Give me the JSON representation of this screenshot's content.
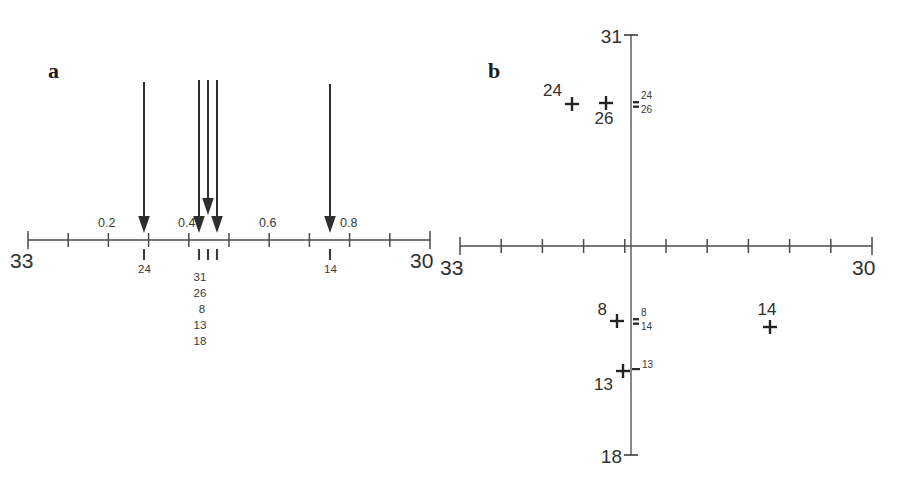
{
  "figure": {
    "background_color": "#ffffff",
    "ink_color": "#2f2f2f"
  },
  "panel_a": {
    "label": "a",
    "axis": {
      "left_endpoint_label": "33",
      "right_endpoint_label": "30",
      "scale_labels": [
        "0.2",
        "0.4",
        "0.6",
        "0.8"
      ],
      "tick_count": 11
    },
    "arrows": [
      {
        "sample": "24",
        "value": 0.28,
        "short": false
      },
      {
        "sample": "31",
        "value": 0.41,
        "short": false
      },
      {
        "sample": "26",
        "value": 0.435,
        "short": true
      },
      {
        "sample": "8",
        "value": 0.455,
        "short": false
      },
      {
        "sample": "14",
        "value": 0.745,
        "short": false
      }
    ],
    "sample_ticks": [
      {
        "label": "24",
        "value": 0.28
      },
      {
        "label": "",
        "value": 0.415
      },
      {
        "label": "",
        "value": 0.437
      },
      {
        "label": "",
        "value": 0.459
      },
      {
        "label": "14",
        "value": 0.745
      }
    ],
    "cluster_labels": [
      "31",
      "26",
      "8",
      "13",
      "18"
    ]
  },
  "panel_b": {
    "label": "b",
    "x_axis": {
      "left_endpoint_label": "33",
      "right_endpoint_label": "30",
      "tick_count": 11
    },
    "y_axis": {
      "top_endpoint_label": "31",
      "bottom_endpoint_label": "18"
    },
    "points": [
      {
        "label": "24",
        "label_pos": "upper-left",
        "x": 572,
        "y": 104
      },
      {
        "label": "26",
        "label_pos": "lower-right",
        "x": 606,
        "y": 103
      },
      {
        "label": "8",
        "label_pos": "upper-left",
        "x": 617,
        "y": 321
      },
      {
        "label": "13",
        "label_pos": "lower-left",
        "x": 623,
        "y": 371
      },
      {
        "label": "14",
        "label_pos": "upper-left",
        "x": 770,
        "y": 327
      }
    ],
    "axis_annotations": [
      {
        "label": "24",
        "marker": "=",
        "y": 96
      },
      {
        "label": "26",
        "marker": "",
        "y": 110
      },
      {
        "label": "8",
        "marker": "=",
        "y": 314
      },
      {
        "label": "14",
        "marker": "",
        "y": 328
      },
      {
        "label": "13",
        "marker": "-",
        "y": 366
      }
    ]
  }
}
